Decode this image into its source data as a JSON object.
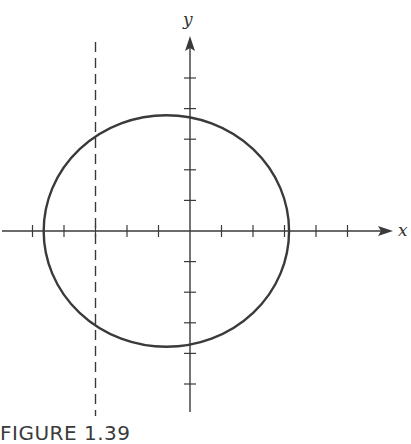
{
  "figure": {
    "caption": "FIGURE 1.39",
    "x_label": "x",
    "y_label": "y",
    "colors": {
      "stroke": "#3a3a3a",
      "axis": "#333333",
      "background": "#ffffff"
    }
  },
  "chart_data": {
    "type": "diagram",
    "title": "FIGURE 1.39",
    "xlabel": "x",
    "ylabel": "y",
    "x_ticks": [
      -5,
      -4,
      -3,
      -2,
      -1,
      1,
      2,
      3,
      4,
      5
    ],
    "y_ticks": [
      -5,
      -4,
      -3,
      -2,
      -1,
      1,
      2,
      3,
      4,
      5
    ],
    "xlim": [
      -6,
      6.5
    ],
    "ylim": [
      -6.2,
      6.3
    ],
    "circle": {
      "center": [
        -0.75,
        0
      ],
      "radius": 3.8
    },
    "dashed_vertical_line": {
      "x": -3
    },
    "grid": false
  }
}
